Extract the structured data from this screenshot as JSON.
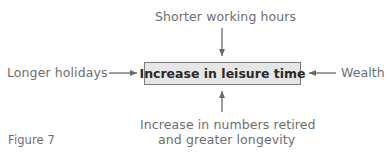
{
  "diagram": {
    "center": "Increase in leisure time",
    "top": "Shorter working hours",
    "left": "Longer holidays",
    "right": "Wealth",
    "bottom_line1": "Increase in numbers retired",
    "bottom_line2": "and greater longevity",
    "caption": "Figure 7"
  },
  "colors": {
    "box_fill": "#e6e6e6",
    "box_border": "#7a7a7a",
    "arrow": "#6a6a6a",
    "text": "#6d6d6d"
  }
}
